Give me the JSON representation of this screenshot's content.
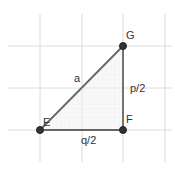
{
  "diagram": {
    "type": "right-triangle",
    "points": [
      {
        "name": "E",
        "x": 40,
        "y": 130
      },
      {
        "name": "F",
        "x": 123,
        "y": 130
      },
      {
        "name": "G",
        "x": 123,
        "y": 46
      }
    ],
    "labels": {
      "E": "E",
      "F": "F",
      "G": "G",
      "hypotenuse": "a",
      "vertical_side": "p/2",
      "horizontal_side": "q/2"
    },
    "colors": {
      "edge": "#666666",
      "point": "#333333",
      "fill": "#e6e6e6",
      "grid": "#dddddd"
    }
  }
}
